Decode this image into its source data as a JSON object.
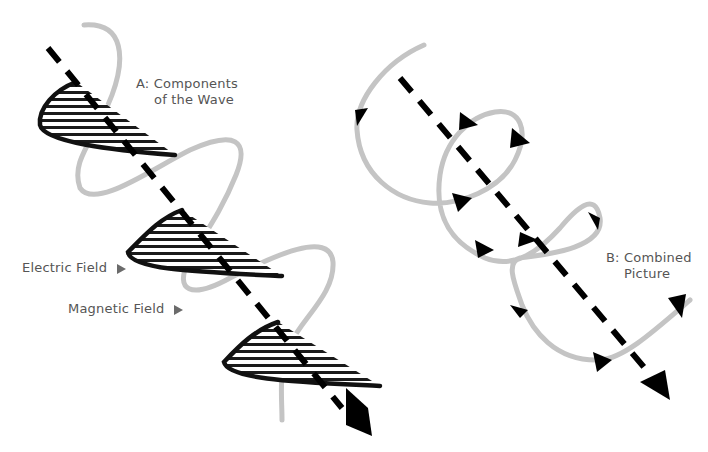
{
  "diagram": {
    "panel_a": {
      "title_line1": "A: Components",
      "title_line2": "of the Wave",
      "legend": [
        {
          "label": "Electric Field",
          "color": "#111111",
          "style": "black curve with horizontal hatching"
        },
        {
          "label": "Magnetic Field",
          "color": "#c4c4c4",
          "style": "gray sinusoid"
        }
      ]
    },
    "panel_b": {
      "title_line1": "B: Combined",
      "title_line2": "Picture"
    },
    "colors": {
      "electric": "#111111",
      "magnetic": "#c4c4c4",
      "axis": "#000000",
      "label_text": "#555555",
      "pointer": "#6b6b6b",
      "background": "#ffffff"
    }
  }
}
